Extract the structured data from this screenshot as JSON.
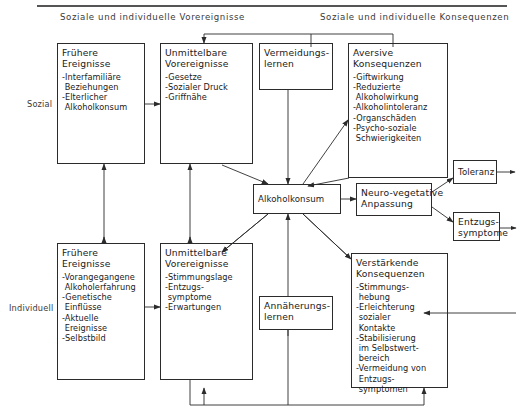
{
  "diagram": {
    "top_rule": true,
    "headers": [
      {
        "id": "antecedents",
        "text": "Soziale und individuelle Vorereignisse"
      },
      {
        "id": "consequences",
        "text": "Soziale und individuelle Konsequenzen"
      }
    ],
    "row_labels": [
      {
        "id": "social",
        "text": "Sozial"
      },
      {
        "id": "individual",
        "text": "Individuell"
      }
    ],
    "boxes": {
      "social_prior_events": {
        "title": "Frühere\nEreignisse",
        "items": [
          "-Interfamiliäre",
          " Beziehungen",
          "-Elterlicher",
          " Alkoholkonsum"
        ]
      },
      "social_immediate_events": {
        "title": "Unmittelbare\nVorereignisse",
        "items": [
          "-Gesetze",
          "-Sozialer Druck",
          "-Griffnähe"
        ]
      },
      "avoidance_learning": {
        "title": "Vermeidungs-\nlernen",
        "items": []
      },
      "aversive_consequences": {
        "title": "Aversive\nKonsequenzen",
        "items": [
          "-Giftwirkung",
          "-Reduzierte",
          " Alkoholwirkung",
          "-Alkoholintoleranz",
          "-Organschäden",
          "-Psycho-soziale",
          " Schwierigkeiten"
        ]
      },
      "alcohol_consumption": {
        "title": "Alkoholkonsum",
        "items": []
      },
      "neuro_vegetative": {
        "title": "Neuro-vegetative\nAnpassung",
        "items": []
      },
      "tolerance": {
        "title": "Toleranz",
        "items": []
      },
      "withdrawal": {
        "title": "Entzugs-\nsymptome",
        "items": []
      },
      "individual_prior_events": {
        "title": "Frühere\nEreignisse",
        "items": [
          "-Vorangegangene",
          " Alkoholerfahrung",
          "-Genetische",
          " Einflüsse",
          "-Aktuelle",
          " Ereignisse",
          "-Selbstbild"
        ]
      },
      "individual_immediate_events": {
        "title": "Unmittelbare\nVorereignisse",
        "items": [
          "-Stimmungslage",
          "-Entzugs-",
          " symptome",
          "-Erwartungen"
        ]
      },
      "approach_learning": {
        "title": "Annäherungs-\nlernen",
        "items": []
      },
      "reinforcing_consequences": {
        "title": "Verstärkende\nKonsequenzen",
        "items": [
          "-Stimmungs-",
          " hebung",
          "-Erleichterung",
          " sozialer",
          " Kontakte",
          "-Stabilisierung",
          " im Selbstwert-",
          " bereich",
          "-Vermeidung von",
          " Entzugs-",
          " symptomen"
        ]
      }
    },
    "colors": {
      "line": "#2b2b2b",
      "text": "#1a1a1a",
      "rule": "#555555",
      "background": "#ffffff"
    }
  }
}
